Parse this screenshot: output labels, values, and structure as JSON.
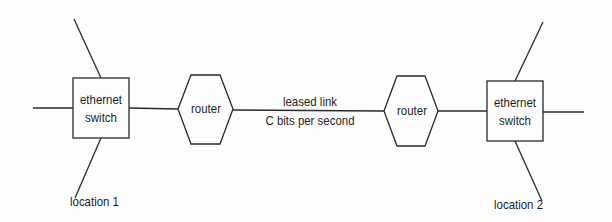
{
  "diagram": {
    "switch_left": {
      "line1": "ethernet",
      "line2": "switch"
    },
    "switch_right": {
      "line1": "ethernet",
      "line2": "switch"
    },
    "router_left": {
      "label": "router"
    },
    "router_right": {
      "label": "router"
    },
    "link": {
      "line1": "leased link",
      "line2": "C bits per second"
    },
    "location_left": "location 1",
    "location_right": "location 2"
  }
}
